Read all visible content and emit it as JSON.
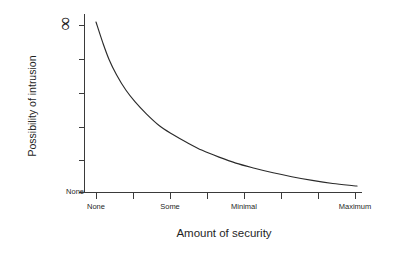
{
  "chart_data": {
    "type": "line",
    "title": "",
    "subtitle": "",
    "xlabel": "Amount of security",
    "ylabel": "Possibility of intrusion",
    "grid": false,
    "legend": null,
    "annotations": [],
    "x_tick_labels": [
      "None",
      "",
      "Some",
      "",
      "Minimal",
      "",
      "",
      "Maximum"
    ],
    "x_tick_positions": [
      0,
      1,
      2,
      3,
      4,
      5,
      6,
      7
    ],
    "x_tick_count": 8,
    "y_tick_labels": [
      "None",
      "",
      "",
      "",
      "",
      "∞"
    ],
    "y_axis_top_label": "∞",
    "y_axis_bottom_label": "None",
    "y_tick_count": 6,
    "xlim": [
      0,
      7
    ],
    "ylim": [
      0,
      1
    ],
    "curve_color": "#2b2b2b",
    "axis_color": "#3a3a3a",
    "background_color": "#ffffff",
    "series": [
      {
        "name": "Possibility of intrusion vs amount of security",
        "shape": "inverse-decay",
        "x": [
          0.0,
          0.18,
          0.35,
          0.55,
          0.8,
          1.05,
          1.35,
          1.7,
          2.05,
          2.45,
          2.85,
          3.3,
          3.75,
          4.25,
          4.75,
          5.25,
          5.8,
          6.35,
          6.9,
          7.0
        ],
        "y": [
          1.0,
          0.88,
          0.78,
          0.69,
          0.6,
          0.53,
          0.46,
          0.39,
          0.34,
          0.29,
          0.245,
          0.205,
          0.17,
          0.14,
          0.113,
          0.09,
          0.068,
          0.05,
          0.037,
          0.035
        ]
      }
    ]
  },
  "axes": {
    "x_title": "Amount of security",
    "y_title": "Possibility of intrusion",
    "x_labels": [
      {
        "text": "None",
        "x_px": 96
      },
      {
        "text": "Some",
        "x_px": 170
      },
      {
        "text": "Minimal",
        "x_px": 244
      },
      {
        "text": "Maximum",
        "x_px": 355
      }
    ],
    "y_labels": [
      {
        "text": "∞",
        "y_px": 25
      },
      {
        "text": "None",
        "y_px": 192
      }
    ]
  }
}
